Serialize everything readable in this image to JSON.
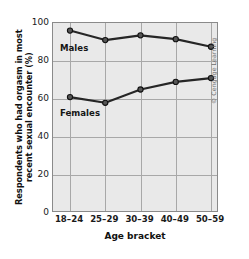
{
  "chart_data": {
    "type": "line",
    "title": "",
    "xlabel": "Age bracket",
    "ylabel": "Respondents who had orgasm in most recent sexual encounter (%)",
    "categories": [
      "18–24",
      "25–29",
      "30–39",
      "40–49",
      "50–59"
    ],
    "series": [
      {
        "name": "Males",
        "values": [
          96,
          91,
          93.5,
          91.5,
          87.5
        ]
      },
      {
        "name": "Females",
        "values": [
          61,
          58,
          65,
          69,
          71
        ]
      }
    ],
    "ylim": [
      0,
      100
    ],
    "yticks": [
      0,
      20,
      40,
      60,
      80,
      100
    ],
    "ytick_labels": [
      "0",
      "20",
      "40",
      "60",
      "80",
      "100"
    ],
    "grid": true,
    "legend_position": "inline-labels",
    "annotations": [
      "Males",
      "Females"
    ],
    "colors": {
      "line": "#262626",
      "marker_fill": "#555555",
      "marker_edge": "#111111",
      "plot_background": "#e9e9e9",
      "gridline": "#a8a8a8",
      "axis": "#8a8a8a",
      "text": "#111111"
    }
  },
  "credit": {
    "text": "© Cengage Learning"
  }
}
